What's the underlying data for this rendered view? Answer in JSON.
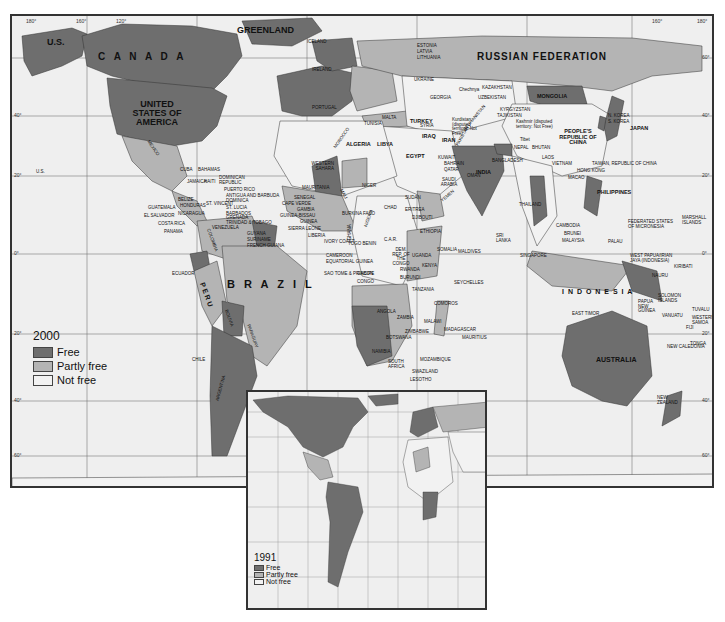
{
  "map": {
    "title_year": "2000",
    "colors": {
      "free": "#6e6e6e",
      "partly_free": "#b4b4b4",
      "not_free": "#f2f2f2",
      "ocean": "#efefef",
      "grid": "#777777"
    },
    "longitude_ticks": [
      "180°",
      "160°",
      "120°",
      "80°",
      "40°",
      "0°",
      "40°",
      "80°",
      "120°",
      "140°",
      "160°",
      "180°"
    ],
    "latitude_ticks_left": [
      "60°",
      "40°",
      "20°",
      "0°",
      "20°",
      "40°",
      "60°"
    ],
    "latitude_ticks_right": [
      "60°",
      "40°",
      "20°",
      "0°",
      "20°",
      "40°",
      "60°"
    ],
    "labels": {
      "us_alaska": "U.S.",
      "canada": "C A N A D A",
      "greenland": "GREENLAND",
      "iceland": "ICELAND",
      "usa": "UNITED STATES OF AMERICA",
      "russia": "RUSSIAN FEDERATION",
      "mongolia": "MONGOLIA",
      "china": "PEOPLE'S REPUBLIC OF CHINA",
      "japan": "JAPAN",
      "korea_n": "N. KOREA",
      "korea_s": "S. KOREA",
      "kazakhstan": "KAZAKHSTAN",
      "uzbekistan": "UZBEKISTAN",
      "kyrgyzstan": "KYRGYZSTAN",
      "tajikistan": "TAJIKISTAN",
      "kashmir": "Kashmir (disputed territory: Not Free)",
      "tibet": "Tibet",
      "nepal": "NEPAL",
      "bhutan": "BHUTAN",
      "bangladesh": "BANGLADESH",
      "india": "INDIA",
      "pakistan": "PAKISTAN",
      "afghanistan": "AFGHANISTAN",
      "iran": "IRAN",
      "iraq": "IRAQ",
      "syria": "SYRIA",
      "turkey": "TURKEY",
      "georgia": "GEORGIA",
      "chechnya": "Chechnya",
      "kurdistan": "Kurdistan (disputed territory: Not Free)",
      "estonia": "ESTONIA",
      "latvia": "LATVIA",
      "lithuania": "LITHUANIA",
      "ukraine": "UKRAINE",
      "ireland": "IRELAND",
      "portugal": "PORTUGAL",
      "morocco": "MOROCCO",
      "tunisia": "TUNISIA",
      "malta": "MALTA",
      "algeria": "ALGERIA",
      "libya": "LIBYA",
      "egypt": "EGYPT",
      "western_sahara": "WESTERN SAHARA",
      "mauritania": "MAURITANIA",
      "mali": "MALI",
      "niger": "NIGER",
      "chad": "CHAD",
      "sudan": "SUDAN",
      "eritrea": "ERITREA",
      "djibouti": "DJIBOUTI",
      "ethiopia": "ETHIOPIA",
      "somalia": "SOMALIA",
      "yemen": "YEMEN",
      "oman": "OMAN",
      "saudi_arabia": "SAUDI ARABIA",
      "qatar": "QATAR",
      "bahrain": "BAHRAIN",
      "kuwait": "KUWAIT",
      "uae": "U.A.E.",
      "senegal": "SENEGAL",
      "cape_verde": "CAPE VERDE",
      "gambia": "GAMBIA",
      "guinea_bissau": "GUINEA-BISSAU",
      "guinea": "GUINEA",
      "sierra_leone": "SIERRA LEONE",
      "liberia": "LIBERIA",
      "ivory_coast": "IVORY COAST",
      "burkina_faso": "BURKINA FASO",
      "ghana": "GHANA",
      "togo_benin": "TOGO BENIN",
      "nigeria": "NIGERIA",
      "cameroon": "CAMEROON",
      "equatorial_guinea": "EQUATORIAL GUINEA",
      "sao_tome": "SAO TOME & PRINCIPE",
      "gabon": "GABON",
      "congo": "CONGO",
      "car": "C.A.R.",
      "drc": "DEM. REP. OF THE CONGO",
      "uganda": "UGANDA",
      "kenya": "KENYA",
      "rwanda": "RWANDA",
      "burundi": "BURUNDI",
      "tanzania": "TANZANIA",
      "seychelles": "SEYCHELLES",
      "comoros": "COMOROS",
      "angola": "ANGOLA",
      "zambia": "ZAMBIA",
      "malawi": "MALAWI",
      "zimbabwe": "ZIMBABWE",
      "namibia": "NAMIBIA",
      "botswana": "BOTSWANA",
      "mozambique": "MOZAMBIQUE",
      "madagascar": "MADAGASCAR",
      "mauritius": "MAURITIUS",
      "south_africa": "SOUTH AFRICA",
      "swaziland": "SWAZILAND",
      "lesotho": "LESOTHO",
      "maldives": "MALDIVES",
      "sri_lanka": "SRI LANKA",
      "thailand": "THAILAND",
      "laos": "LAOS",
      "vietnam": "VIETNAM",
      "cambodia": "CAMBODIA",
      "hong_kong": "HONG KONG",
      "macao": "MACAO",
      "taiwan": "TAIWAN, REPUBLIC OF CHINA",
      "philippines": "PHILIPPINES",
      "malaysia": "MALAYSIA",
      "brunei": "BRUNEI",
      "singapore": "SINGAPORE",
      "indonesia": "I N D O N E S I A",
      "east_timor": "EAST TIMOR",
      "palau": "PALAU",
      "micronesia": "FEDERATED STATES OF MICRONESIA",
      "marshall": "MARSHALL ISLANDS",
      "west_papua": "WEST PAPUA/IRIAN JAYA (INDONESIA)",
      "nauru": "NAURU",
      "kiribati": "KIRIBATI",
      "png": "PAPUA NEW GUINEA",
      "solomon": "SOLOMON ISLANDS",
      "tuvalu": "TUVALU",
      "vanuatu": "VANUATU",
      "w_samoa": "WESTERN SAMOA",
      "fiji": "FIJI",
      "new_caledonia": "NEW CALEDONIA",
      "tonga": "TONGA",
      "australia": "AUSTRALIA",
      "new_zealand": "NEW ZEALAND",
      "mexico": "MEXICO",
      "cuba": "CUBA",
      "bahamas": "BAHAMAS",
      "jamaica": "JAMAICA",
      "haiti": "HAITI",
      "dominican_republic": "DOMINICAN REPUBLIC",
      "puerto_rico": "PUERTO RICO",
      "antigua": "ANTIGUA AND BARBUDA",
      "dominica": "DOMINICA",
      "st_lucia": "ST. LUCIA",
      "st_vincent": "ST. VINCENT",
      "barbados": "BARBADOS",
      "grenada": "GRENADA",
      "trinidad": "TRINIDAD & TOBAGO",
      "belize": "BELIZE",
      "guatemala": "GUATEMALA",
      "honduras": "HONDURAS",
      "el_salvador": "EL SALVADOR",
      "nicaragua": "NICARAGUA",
      "costa_rica": "COSTA RICA",
      "panama": "PANAMA",
      "venezuela": "VENEZUELA",
      "colombia": "COLOMBIA",
      "guyana": "GUYANA",
      "suriname": "SURINAME",
      "french_guiana": "FRENCH GUIANA",
      "ecuador": "ECUADOR",
      "peru": "P E R U",
      "brazil": "B R A Z I L",
      "bolivia": "BOLIVIA",
      "paraguay": "PARAGUAY",
      "chile": "CHILE",
      "argentina": "ARGENTINA",
      "uruguay": "URUGUAY",
      "us_hawaii": "U.S."
    }
  },
  "legend_2000": {
    "title": "2000",
    "items": [
      {
        "label": "Free",
        "key": "free"
      },
      {
        "label": "Partly free",
        "key": "partly_free"
      },
      {
        "label": "Not free",
        "key": "not_free"
      }
    ]
  },
  "inset": {
    "legend": {
      "title": "1991",
      "items": [
        {
          "label": "Free",
          "key": "free"
        },
        {
          "label": "Partly free",
          "key": "partly_free"
        },
        {
          "label": "Not free",
          "key": "not_free"
        }
      ]
    }
  }
}
